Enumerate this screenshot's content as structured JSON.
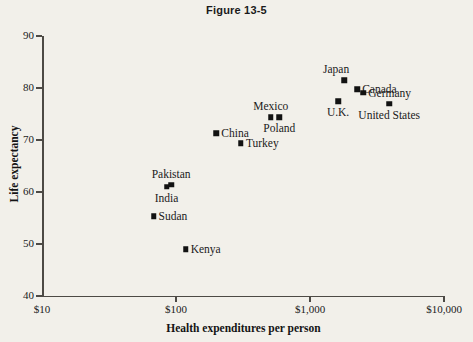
{
  "chart_data": {
    "type": "scatter",
    "title": "Figure 13-5",
    "xlabel": "Health expenditures per person",
    "ylabel": "Life expectancy",
    "xscale": "log",
    "xlim": [
      10,
      10000
    ],
    "ylim": [
      40,
      90
    ],
    "grid": false,
    "legend": "none",
    "xticks": [
      {
        "value": 10,
        "label": "$10"
      },
      {
        "value": 100,
        "label": "$100"
      },
      {
        "value": 1000,
        "label": "$1,000"
      },
      {
        "value": 10000,
        "label": "$10,000"
      }
    ],
    "yticks": [
      {
        "value": 40,
        "label": "40"
      },
      {
        "value": 50,
        "label": "50"
      },
      {
        "value": 60,
        "label": "60"
      },
      {
        "value": 70,
        "label": "70"
      },
      {
        "value": 80,
        "label": "80"
      },
      {
        "value": 90,
        "label": "90"
      }
    ],
    "points": [
      {
        "name": "Sudan",
        "x": 68,
        "y": 55.3,
        "label": "Sudan",
        "label_pos": "right"
      },
      {
        "name": "India",
        "x": 85,
        "y": 61.0,
        "label": "India",
        "label_pos": "below"
      },
      {
        "name": "Pakistan",
        "x": 92,
        "y": 61.4,
        "label": "Pakistan",
        "label_pos": "above"
      },
      {
        "name": "Kenya",
        "x": 118,
        "y": 49.0,
        "label": "Kenya",
        "label_pos": "right"
      },
      {
        "name": "China",
        "x": 200,
        "y": 71.3,
        "label": "China",
        "label_pos": "right"
      },
      {
        "name": "Turkey",
        "x": 305,
        "y": 69.4,
        "label": "Turkey",
        "label_pos": "right"
      },
      {
        "name": "Mexico",
        "x": 510,
        "y": 74.4,
        "label": "Mexico",
        "label_pos": "above"
      },
      {
        "name": "Poland",
        "x": 590,
        "y": 74.4,
        "label": "Poland",
        "label_pos": "below"
      },
      {
        "name": "U.K.",
        "x": 1620,
        "y": 77.5,
        "label": "U.K.",
        "label_pos": "below"
      },
      {
        "name": "Japan",
        "x": 1800,
        "y": 81.5,
        "label": "Japan",
        "label_pos": "above-left"
      },
      {
        "name": "Canada",
        "x": 2250,
        "y": 79.8,
        "label": "Canada",
        "label_pos": "right"
      },
      {
        "name": "Germany",
        "x": 2500,
        "y": 79.1,
        "label": "Germany",
        "label_pos": "right"
      },
      {
        "name": "United States",
        "x": 3900,
        "y": 77.0,
        "label": "United States",
        "label_pos": "below"
      }
    ]
  },
  "layout": {
    "plot_left": 42,
    "plot_right": 444,
    "plot_top": 36,
    "plot_bottom": 296
  },
  "colors": {
    "background": "#f2f0ea",
    "axis": "#4d4a45",
    "marker": "#121212",
    "text": "#1a1a1a"
  }
}
